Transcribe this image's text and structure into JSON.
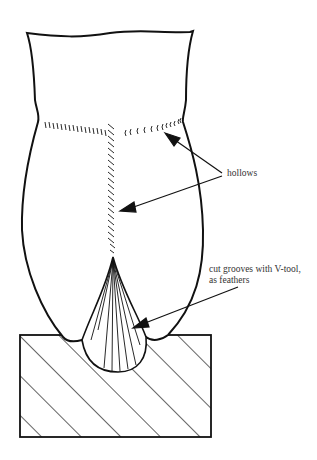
{
  "diagram": {
    "labels": {
      "hollows": "hollows",
      "grooves_line1": "cut grooves with V-tool,",
      "grooves_line2": "as feathers"
    },
    "colors": {
      "stroke": "#111111",
      "text": "#333333",
      "background": "#ffffff"
    }
  }
}
